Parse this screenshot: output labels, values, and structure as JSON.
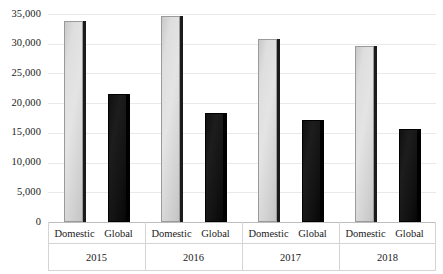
{
  "chart_data": {
    "type": "bar",
    "title": "",
    "subtitle": "",
    "xlabel": "",
    "ylabel": "",
    "ylim": [
      0,
      35000
    ],
    "grid": true,
    "legend_position": "none",
    "categories": [
      "2015",
      "2016",
      "2017",
      "2018"
    ],
    "subcategories": [
      "Domestic",
      "Global"
    ],
    "series": [
      {
        "name": "Domestic",
        "color": "#dcdcdc",
        "values": [
          33800,
          34700,
          30800,
          29600
        ]
      },
      {
        "name": "Global",
        "color": "#121212",
        "values": [
          21600,
          18400,
          17200,
          15600
        ]
      }
    ],
    "y_ticks": [
      0,
      5000,
      10000,
      15000,
      20000,
      25000,
      30000,
      35000
    ],
    "y_tick_labels": [
      "0",
      "5,000",
      "10,000",
      "15,000",
      "20,000",
      "25,000",
      "30,000",
      "35,000"
    ],
    "bars": [
      {
        "group": "2015",
        "label": "Domestic",
        "series": "Domestic",
        "value": 33800
      },
      {
        "group": "2015",
        "label": "Global",
        "series": "Global",
        "value": 21600
      },
      {
        "group": "2016",
        "label": "Domestic",
        "series": "Domestic",
        "value": 34700
      },
      {
        "group": "2016",
        "label": "Global",
        "series": "Global",
        "value": 18400
      },
      {
        "group": "2017",
        "label": "Domestic",
        "series": "Domestic",
        "value": 30800
      },
      {
        "group": "2017",
        "label": "Global",
        "series": "Global",
        "value": 17200
      },
      {
        "group": "2018",
        "label": "Domestic",
        "series": "Domestic",
        "value": 29600
      },
      {
        "group": "2018",
        "label": "Global",
        "series": "Global",
        "value": 15600
      }
    ]
  }
}
